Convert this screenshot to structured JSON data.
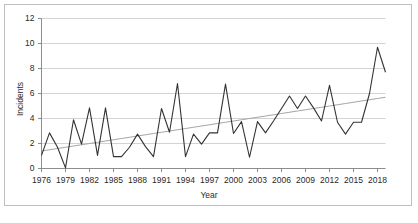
{
  "chart_data": {
    "type": "line",
    "title": "",
    "xlabel": "Year",
    "ylabel": "Incidents",
    "xlim": [
      1976,
      2019
    ],
    "ylim": [
      0,
      12
    ],
    "yticks": [
      0,
      2,
      4,
      6,
      8,
      10,
      12
    ],
    "xticks": [
      1976,
      1979,
      1982,
      1985,
      1988,
      1991,
      1994,
      1997,
      2000,
      2003,
      2006,
      2009,
      2012,
      2015,
      2018
    ],
    "grid": "horizontal",
    "legend": "none",
    "x": [
      1976,
      1977,
      1978,
      1979,
      1980,
      1981,
      1982,
      1983,
      1984,
      1985,
      1986,
      1987,
      1988,
      1989,
      1990,
      1991,
      1992,
      1993,
      1994,
      1995,
      1996,
      1997,
      1998,
      1999,
      2000,
      2001,
      2002,
      2003,
      2004,
      2005,
      2006,
      2007,
      2008,
      2009,
      2010,
      2011,
      2012,
      2013,
      2014,
      2015,
      2016,
      2017,
      2018,
      2019
    ],
    "series": [
      {
        "name": "Incidents",
        "color": "#333333",
        "values": [
          1.05,
          2.85,
          1.7,
          0.05,
          3.9,
          1.95,
          4.85,
          1.05,
          4.85,
          0.95,
          0.95,
          1.7,
          2.75,
          1.75,
          0.95,
          4.8,
          2.9,
          6.8,
          0.95,
          2.75,
          1.95,
          2.85,
          2.85,
          6.75,
          2.8,
          3.75,
          0.9,
          3.75,
          2.85,
          3.8,
          4.8,
          5.8,
          4.8,
          5.8,
          4.85,
          3.8,
          6.65,
          3.7,
          2.75,
          3.7,
          3.7,
          6.0,
          9.7,
          7.7
        ]
      },
      {
        "name": "Linear trend",
        "color": "#9a9a9a",
        "values": [
          1.4,
          1.5,
          1.6,
          1.7,
          1.8,
          1.9,
          2.0,
          2.1,
          2.2,
          2.3,
          2.4,
          2.5,
          2.6,
          2.7,
          2.8,
          2.9,
          3.0,
          3.1,
          3.2,
          3.3,
          3.4,
          3.5,
          3.6,
          3.7,
          3.8,
          3.9,
          4.0,
          4.1,
          4.2,
          4.3,
          4.4,
          4.5,
          4.6,
          4.7,
          4.8,
          4.9,
          5.0,
          5.1,
          5.2,
          5.3,
          5.4,
          5.5,
          5.6,
          5.7
        ]
      }
    ],
    "colors": {
      "gridline": "#c8c8c8",
      "axis": "#808080",
      "frame": "#bfbfbf",
      "background": "#ffffff",
      "text": "#2a2a2a"
    }
  }
}
